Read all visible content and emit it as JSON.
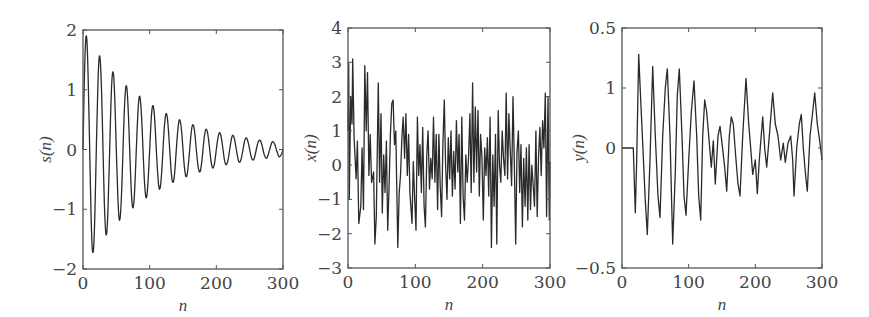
{
  "chart_data": [
    {
      "type": "line",
      "id": "s",
      "title": "",
      "xlabel": "n",
      "ylabel": "s(n)",
      "xlim": [
        0,
        300
      ],
      "ylim": [
        -2,
        2
      ],
      "xticks": [
        0,
        100,
        200,
        300
      ],
      "xtick_labels": [
        "0",
        "100",
        "200",
        "300"
      ],
      "yticks": [
        2,
        1,
        0,
        -1,
        -2
      ],
      "ytick_labels": [
        "2",
        "1",
        "0",
        "−1",
        "−2"
      ],
      "grid": false,
      "frame": {
        "left": 83,
        "top": 30,
        "right": 283,
        "bottom": 269
      },
      "series": [
        {
          "name": "s(n)",
          "x_step": 2,
          "x_start": 0,
          "values": [
            0,
            1.15,
            1.83,
            1.8,
            1.09,
            0,
            -1.05,
            -1.66,
            -1.63,
            -0.99,
            0,
            0.95,
            1.51,
            1.48,
            0.9,
            0,
            -0.87,
            -1.38,
            -1.35,
            -0.82,
            0,
            0.79,
            1.25,
            1.23,
            0.74,
            0,
            -0.72,
            -1.14,
            -1.12,
            -0.68,
            0,
            0.65,
            1.03,
            1.01,
            0.62,
            0,
            -0.59,
            -0.94,
            -0.92,
            -0.56,
            0,
            0.54,
            0.86,
            0.84,
            0.51,
            0,
            -0.49,
            -0.78,
            -0.76,
            -0.46,
            0,
            0.45,
            0.71,
            0.69,
            0.42,
            0,
            -0.4,
            -0.64,
            -0.63,
            -0.38,
            0,
            0.37,
            0.58,
            0.57,
            0.35,
            0,
            -0.33,
            -0.53,
            -0.52,
            -0.32,
            0,
            0.3,
            0.48,
            0.47,
            0.29,
            0,
            -0.28,
            -0.44,
            -0.43,
            -0.26,
            0,
            0.25,
            0.4,
            0.39,
            0.24,
            0,
            -0.23,
            -0.36,
            -0.36,
            -0.22,
            0,
            0.21,
            0.33,
            0.32,
            0.2,
            0,
            -0.19,
            -0.3,
            -0.29,
            -0.18,
            0,
            0.17,
            0.27,
            0.27,
            0.16,
            0,
            -0.16,
            -0.25,
            -0.24,
            -0.15,
            0,
            0.14,
            0.23,
            0.22,
            0.13,
            0,
            -0.13,
            -0.21,
            -0.2,
            -0.12,
            0,
            0.12,
            0.19,
            0.18,
            0.11,
            0,
            -0.11,
            -0.17,
            -0.17,
            -0.1,
            0,
            0.1,
            0.15,
            0.15,
            0.09,
            0,
            -0.09,
            -0.14,
            -0.14,
            -0.08,
            0,
            0.08,
            0.13,
            0.12,
            0.08,
            0,
            -0.07,
            -0.12,
            -0.11,
            -0.07,
            0
          ]
        }
      ],
      "description": "Exponentially damped sinusoid, period ~20 samples, peak ~1.9 at n≈5 decaying to ~0.12 at n=300"
    },
    {
      "type": "line",
      "id": "x",
      "title": "",
      "xlabel": "n",
      "ylabel": "x(n)",
      "xlim": [
        0,
        300
      ],
      "ylim": [
        -3,
        4
      ],
      "xticks": [
        0,
        100,
        200,
        300
      ],
      "xtick_labels": [
        "0",
        "100",
        "200",
        "300"
      ],
      "yticks": [
        4,
        3,
        2,
        1,
        0,
        -1,
        -2,
        -3
      ],
      "ytick_labels": [
        "4",
        "3",
        "2",
        "1",
        "0",
        "−1",
        "−2",
        "−3"
      ],
      "grid": false,
      "frame": {
        "left": 348,
        "top": 28,
        "right": 550,
        "bottom": 268
      },
      "series": [
        {
          "name": "x(n)",
          "x": [
            0,
            1,
            2,
            4,
            6,
            7,
            9,
            12,
            14,
            16,
            19,
            21,
            23,
            25,
            27,
            29,
            31,
            33,
            35,
            38,
            40,
            42,
            45,
            47,
            49,
            51,
            53,
            55,
            57,
            59,
            61,
            63,
            65,
            67,
            69,
            71,
            74,
            76,
            78,
            80,
            82,
            84,
            86,
            88,
            90,
            92,
            95,
            97,
            99,
            101,
            103,
            105,
            107,
            109,
            111,
            113,
            115,
            117,
            119,
            121,
            123,
            125,
            127,
            129,
            131,
            133,
            135,
            137,
            139,
            141,
            143,
            145,
            147,
            149,
            151,
            153,
            155,
            157,
            159,
            161,
            163,
            165,
            167,
            169,
            171,
            173,
            175,
            177,
            179,
            181,
            183,
            185,
            187,
            189,
            191,
            193,
            195,
            197,
            199,
            201,
            203,
            205,
            207,
            209,
            211,
            213,
            215,
            217,
            219,
            221,
            223,
            225,
            227,
            229,
            231,
            233,
            235,
            237,
            239,
            241,
            243,
            245,
            247,
            249,
            251,
            253,
            255,
            257,
            259,
            261,
            263,
            265,
            267,
            269,
            271,
            273,
            275,
            277,
            279,
            281,
            283,
            285,
            287,
            289,
            291,
            293,
            295,
            297,
            299,
            300
          ],
          "values": [
            1.0,
            3.0,
            -1.0,
            2.0,
            1.2,
            3.1,
            0.8,
            -0.4,
            0.7,
            -1.7,
            -1.2,
            0.5,
            -1.3,
            2.9,
            1.0,
            2.7,
            -0.3,
            0.9,
            -0.5,
            -0.2,
            -2.3,
            -1.5,
            2.4,
            -0.5,
            1.5,
            -1.4,
            0.3,
            -0.8,
            0.7,
            -1.9,
            -0.6,
            0.9,
            1.8,
            1.9,
            0.6,
            1.0,
            -2.4,
            -0.8,
            -0.3,
            0.8,
            1.4,
            0.2,
            1.5,
            -0.3,
            0.9,
            -0.8,
            -1.7,
            0.1,
            -1.0,
            -1.9,
            1.4,
            -0.3,
            0.6,
            -0.8,
            1.1,
            -1.2,
            -1.8,
            0.3,
            1.0,
            -0.7,
            0.2,
            -0.4,
            1.4,
            -0.5,
            0.9,
            -1.3,
            0.9,
            -0.6,
            -1.5,
            0.6,
            1.9,
            0.0,
            -1.0,
            0.8,
            -0.4,
            1.0,
            -0.9,
            0.4,
            -0.7,
            1.3,
            -0.2,
            0.9,
            -1.7,
            1.4,
            -0.9,
            -1.6,
            0.3,
            -0.5,
            0.2,
            1.5,
            -0.8,
            2.4,
            -0.5,
            1.7,
            -0.2,
            1.6,
            -0.9,
            0.9,
            0.2,
            -1.6,
            0.5,
            -0.3,
            0.8,
            -0.9,
            1.4,
            -2.4,
            0.3,
            -1.2,
            0.9,
            -2.3,
            1.6,
            0.0,
            -0.5,
            1.0,
            0.2,
            -0.3,
            2.1,
            -0.4,
            1.5,
            0.4,
            -0.6,
            2.0,
            0.1,
            -2.3,
            0.4,
            1.0,
            -0.8,
            0.6,
            -1.8,
            0.2,
            -1.2,
            0.5,
            -1.6,
            0.6,
            -1.3,
            0.0,
            -0.6,
            -1.2,
            1.0,
            -1.5,
            0.3,
            1.1,
            -0.3,
            1.3,
            0.5,
            2.1,
            -1.5,
            2.0,
            -1.6,
            0.1
          ]
        }
      ],
      "description": "Noisy observed signal, values roughly between -2.4 and 3.1"
    },
    {
      "type": "line",
      "id": "y",
      "title": "",
      "xlabel": "n",
      "ylabel": "y(n)",
      "xlim": [
        0,
        300
      ],
      "ylim": [
        -0.5,
        0.5
      ],
      "xticks": [
        0,
        100,
        200,
        300
      ],
      "xtick_labels": [
        "0",
        "100",
        "200",
        "300"
      ],
      "yticks": [
        0.5,
        0.25,
        0,
        -0.5
      ],
      "ytick_labels": [
        "0.5",
        "1",
        "0",
        "−0.5"
      ],
      "grid": false,
      "frame": {
        "left": 622,
        "top": 28,
        "right": 822,
        "bottom": 268
      },
      "series": [
        {
          "name": "y(n)",
          "x": [
            0,
            15,
            17,
            20,
            22,
            25,
            28,
            31,
            35,
            38,
            42,
            46,
            50,
            54,
            57,
            61,
            65,
            68,
            72,
            76,
            80,
            83,
            86,
            90,
            93,
            96,
            100,
            104,
            108,
            112,
            115,
            118,
            121,
            124,
            127,
            130,
            134,
            137,
            140,
            144,
            147,
            150,
            154,
            157,
            161,
            164,
            167,
            171,
            174,
            177,
            181,
            186,
            190,
            193,
            196,
            200,
            203,
            206,
            211,
            214,
            217,
            221,
            226,
            230,
            234,
            238,
            242,
            245,
            249,
            253,
            256,
            258,
            262,
            266,
            269,
            272,
            275,
            278,
            282,
            286,
            289,
            293,
            297,
            300
          ],
          "values": [
            0,
            0,
            0,
            -0.27,
            -0.05,
            0.39,
            0.2,
            0.02,
            -0.22,
            -0.36,
            -0.05,
            0.34,
            0.05,
            -0.2,
            -0.29,
            0.05,
            0.25,
            0.33,
            0.05,
            -0.4,
            -0.1,
            0.22,
            0.33,
            0.05,
            -0.2,
            -0.28,
            -0.05,
            0.15,
            0.28,
            0.05,
            -0.2,
            -0.3,
            0.05,
            0.2,
            0.15,
            0.05,
            -0.08,
            0.03,
            -0.15,
            0.05,
            0.09,
            0.02,
            -0.08,
            -0.18,
            0.05,
            0.13,
            0.1,
            -0.05,
            -0.15,
            -0.2,
            0.05,
            0.29,
            0.1,
            0.0,
            -0.11,
            -0.05,
            -0.19,
            -0.05,
            0.13,
            0.0,
            -0.08,
            0.05,
            0.23,
            0.1,
            0.05,
            -0.05,
            0.02,
            -0.06,
            0.02,
            0.05,
            -0.05,
            -0.2,
            0.0,
            0.1,
            0.14,
            0.0,
            -0.1,
            -0.18,
            0.05,
            0.15,
            0.23,
            0.1,
            0.02,
            -0.05
          ]
        }
      ],
      "description": "Filtered output: zero until n≈17, then oscillations of amplitude ~0.4 decaying to ~0.2 with irregular components"
    }
  ]
}
